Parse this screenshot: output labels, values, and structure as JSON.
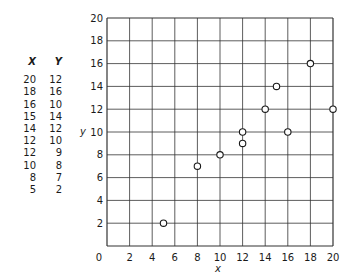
{
  "table": {
    "headers": [
      "X",
      "Y"
    ],
    "rows": [
      [
        20,
        12
      ],
      [
        18,
        16
      ],
      [
        16,
        10
      ],
      [
        15,
        14
      ],
      [
        14,
        12
      ],
      [
        12,
        10
      ],
      [
        12,
        9
      ],
      [
        10,
        8
      ],
      [
        8,
        7
      ],
      [
        5,
        2
      ]
    ]
  },
  "chart_data": {
    "type": "scatter",
    "title": "",
    "xlabel": "x",
    "ylabel": "y",
    "xlim": [
      0,
      20
    ],
    "ylim": [
      0,
      20
    ],
    "xticks": [
      0,
      2,
      4,
      6,
      8,
      10,
      12,
      14,
      16,
      18,
      20
    ],
    "yticks": [
      2,
      4,
      6,
      8,
      10,
      12,
      14,
      16,
      18,
      20
    ],
    "grid": true,
    "marker": "open-circle",
    "x": [
      20,
      18,
      16,
      15,
      14,
      12,
      12,
      10,
      8,
      5
    ],
    "y": [
      12,
      16,
      10,
      14,
      12,
      10,
      9,
      8,
      7,
      2
    ]
  },
  "colors": {
    "ink": "#1a1a1a",
    "grid": "#333333",
    "background": "#ffffff"
  }
}
